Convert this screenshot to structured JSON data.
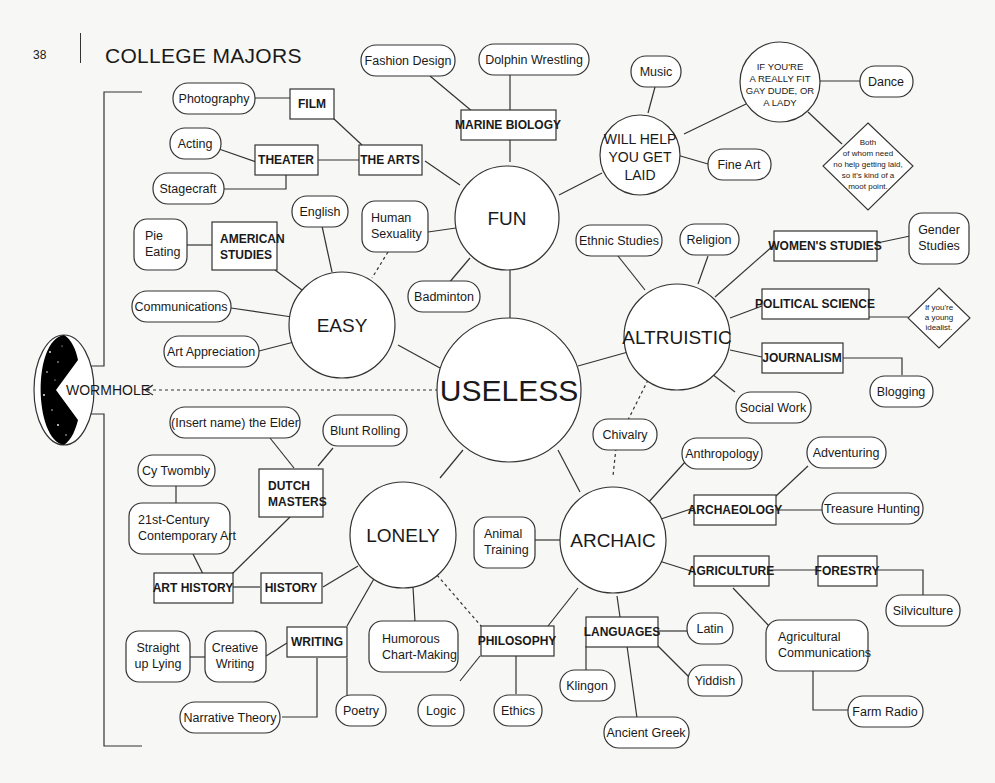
{
  "page": {
    "number": "38",
    "title": "COLLEGE MAJORS"
  },
  "colors": {
    "line": "#333333",
    "background": "#f7f7f5",
    "node_fill": "#ffffff",
    "wormhole": "#000000"
  },
  "wormhole": {
    "label": "WORMHOLE"
  },
  "hubs": {
    "useless": "USELESS",
    "fun": "FUN",
    "easy": "EASY",
    "altruistic": "ALTRUISTIC",
    "lonely": "LONELY",
    "archaic": "ARCHAIC",
    "laid": [
      "WILL HELP",
      "YOU GET",
      "LAID"
    ],
    "fit": [
      "IF YOU'RE",
      "A REALLY FIT",
      "GAY DUDE, OR",
      "A LADY"
    ]
  },
  "boxes": {
    "film": "FILM",
    "the_arts": "THE ARTS",
    "theater": "THEATER",
    "marine_biology": "MARINE BIOLOGY",
    "american_studies": [
      "AMERICAN",
      "STUDIES"
    ],
    "womens_studies": "WOMEN'S STUDIES",
    "political_science": "POLITICAL SCIENCE",
    "journalism": "JOURNALISM",
    "dutch_masters": [
      "DUTCH",
      "MASTERS"
    ],
    "art_history": "ART HISTORY",
    "history": "HISTORY",
    "writing": "WRITING",
    "philosophy": "PHILOSOPHY",
    "languages": "LANGUAGES",
    "archaeology": "ARCHAEOLOGY",
    "agriculture": "AGRICULTURE",
    "forestry": "FORESTRY"
  },
  "pills": {
    "fashion_design": "Fashion Design",
    "dolphin_wrestling": "Dolphin Wrestling",
    "photography": "Photography",
    "acting": "Acting",
    "stagecraft": "Stagecraft",
    "music": "Music",
    "dance": "Dance",
    "fine_art": "Fine Art",
    "english": "English",
    "human_sexuality": [
      "Human",
      "Sexuality"
    ],
    "pie_eating": [
      "Pie",
      "Eating"
    ],
    "communications": "Communications",
    "art_appreciation": "Art Appreciation",
    "badminton": "Badminton",
    "ethnic_studies": "Ethnic Studies",
    "religion": "Religion",
    "gender_studies": [
      "Gender",
      "Studies"
    ],
    "blogging": "Blogging",
    "social_work": "Social Work",
    "chivalry": "Chivalry",
    "insert_name_elder": "(Insert name) the Elder",
    "blunt_rolling": "Blunt Rolling",
    "cy_twombly": "Cy Twombly",
    "contemporary_art": [
      "21st-Century",
      "Contemporary Art"
    ],
    "anthropology": "Anthropology",
    "adventuring": "Adventuring",
    "treasure_hunting": "Treasure Hunting",
    "animal_training": [
      "Animal",
      "Training"
    ],
    "silviculture": "Silviculture",
    "straight_up_lying": [
      "Straight",
      "up Lying"
    ],
    "creative_writing": [
      "Creative",
      "Writing"
    ],
    "humorous_chart_making": [
      "Humorous",
      "Chart-Making"
    ],
    "narrative_theory": "Narrative Theory",
    "poetry": "Poetry",
    "logic": "Logic",
    "ethics": "Ethics",
    "latin": "Latin",
    "klingon": "Klingon",
    "yiddish": "Yiddish",
    "ancient_greek": "Ancient Greek",
    "agricultural_communications": [
      "Agricultural",
      "Communications"
    ],
    "farm_radio": "Farm Radio"
  },
  "diamonds": {
    "both_of_whom": [
      "Both",
      "of whom need",
      "no help getting laid,",
      "so it's kind of a",
      "moot point."
    ],
    "young_idealist": [
      "If you're",
      "a young",
      "idealist."
    ]
  }
}
